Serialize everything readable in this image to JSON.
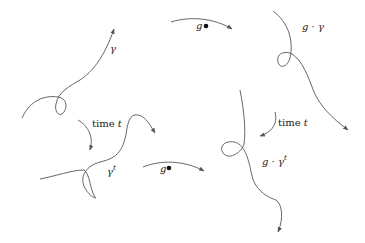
{
  "diagram": {
    "labels": {
      "gamma": "γ",
      "g_gamma": "g · γ",
      "gamma_t": "γ",
      "gamma_t_sup": "t",
      "g_gamma_t": "g · γ",
      "g_gamma_t_sup": "t",
      "time_left_word": "time ",
      "time_left_var": "t",
      "time_right_word": "time ",
      "time_right_var": "t",
      "action_top": "g",
      "action_bottom": "g"
    },
    "arrows": [
      {
        "from": "γ",
        "to": "g · γ",
        "label": "g•"
      },
      {
        "from": "γ",
        "to": "γ^t",
        "label": "time t"
      },
      {
        "from": "g · γ",
        "to": "g · γ^t",
        "label": "time t"
      },
      {
        "from": "γ^t",
        "to": "g · γ^t",
        "label": "g•"
      }
    ],
    "stroke_color": "#555555"
  }
}
